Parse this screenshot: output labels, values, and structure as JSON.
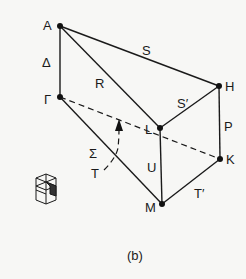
{
  "figure": {
    "caption": "(b)",
    "points": [
      {
        "id": "A",
        "label": "A",
        "x": 60,
        "y": 26
      },
      {
        "id": "Gamma",
        "label": "Γ",
        "x": 60,
        "y": 97
      },
      {
        "id": "H",
        "label": "H",
        "x": 219,
        "y": 86
      },
      {
        "id": "L",
        "label": "L",
        "x": 160,
        "y": 128
      },
      {
        "id": "K",
        "label": "K",
        "x": 220,
        "y": 159
      },
      {
        "id": "M",
        "label": "M",
        "x": 162,
        "y": 204
      }
    ],
    "edges": [
      {
        "from": "A",
        "to": "Gamma",
        "label": "Δ",
        "style": "solid"
      },
      {
        "from": "A",
        "to": "H",
        "label": "S",
        "style": "solid"
      },
      {
        "from": "A",
        "to": "L",
        "label": "R",
        "style": "solid"
      },
      {
        "from": "H",
        "to": "L",
        "label": "S′",
        "style": "solid"
      },
      {
        "from": "H",
        "to": "K",
        "label": "P",
        "style": "solid"
      },
      {
        "from": "L",
        "to": "M",
        "label": "U",
        "style": "solid"
      },
      {
        "from": "Gamma",
        "to": "M",
        "label": "Σ",
        "style": "solid"
      },
      {
        "from": "M",
        "to": "K",
        "label": "T′",
        "style": "solid"
      },
      {
        "from": "Gamma",
        "to": "K",
        "label": "",
        "style": "dashed"
      }
    ],
    "annotations": {
      "T_label": "T",
      "arrow": "curved dashed arrow from T toward Γ–K dashed line"
    },
    "labels": {
      "A": "A",
      "Delta": "Δ",
      "Gamma": "Γ",
      "R": "R",
      "S": "S",
      "S_prime": "S′",
      "H": "H",
      "P": "P",
      "L": "L",
      "U": "U",
      "Sigma": "Σ",
      "T": "T",
      "K": "K",
      "T_prime": "T′",
      "M": "M"
    },
    "inset": "hexagonal prism Brillouin zone thumbnail"
  }
}
